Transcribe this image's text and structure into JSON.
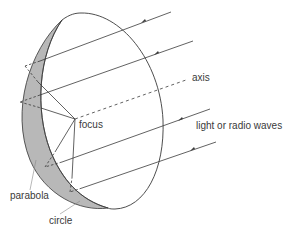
{
  "labels": {
    "axis": "axis",
    "focus": "focus",
    "waves": "light or radio waves",
    "parabola": "parabola",
    "circle": "circle"
  },
  "colors": {
    "line": "#3a3a3a",
    "band_fill": "#b8b8b8",
    "background": "#ffffff"
  },
  "rays": [
    {
      "start": [
        171,
        12
      ],
      "hit": [
        40,
        61
      ]
    },
    {
      "start": [
        193,
        41
      ],
      "hit": [
        40,
        95
      ]
    },
    {
      "start": [
        210,
        109
      ],
      "hit": [
        62,
        162
      ]
    },
    {
      "start": [
        216,
        142
      ],
      "hit": [
        82,
        188
      ]
    }
  ],
  "focus_point": [
    75,
    119
  ]
}
